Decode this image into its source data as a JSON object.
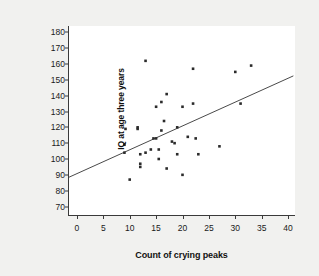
{
  "chart_data": {
    "type": "scatter",
    "title": "",
    "xlabel": "Count of crying peaks",
    "ylabel": "IQ at age three years",
    "xlim": [
      -1.5,
      41.5
    ],
    "ylim": [
      64,
      184
    ],
    "xticks": [
      0,
      5,
      10,
      15,
      20,
      25,
      30,
      35,
      40
    ],
    "yticks": [
      70,
      80,
      90,
      100,
      110,
      120,
      130,
      140,
      150,
      160,
      170,
      180
    ],
    "grid": false,
    "legend": false,
    "point_color": "#2b2b2b",
    "line_color": "#4a4a4a",
    "background": "#ffffff",
    "figure_background": "#f1f1ef",
    "points": [
      {
        "x": 10.0,
        "y": 87
      },
      {
        "x": 9.0,
        "y": 104
      },
      {
        "x": 9.0,
        "y": 109
      },
      {
        "x": 9.2,
        "y": 119
      },
      {
        "x": 11.5,
        "y": 119
      },
      {
        "x": 11.5,
        "y": 120
      },
      {
        "x": 12.0,
        "y": 103
      },
      {
        "x": 12.0,
        "y": 95
      },
      {
        "x": 12.0,
        "y": 97
      },
      {
        "x": 13.0,
        "y": 104
      },
      {
        "x": 13.0,
        "y": 162
      },
      {
        "x": 14.0,
        "y": 106
      },
      {
        "x": 14.5,
        "y": 113
      },
      {
        "x": 15.0,
        "y": 113
      },
      {
        "x": 15.0,
        "y": 133
      },
      {
        "x": 15.5,
        "y": 100
      },
      {
        "x": 15.5,
        "y": 106
      },
      {
        "x": 16.0,
        "y": 118
      },
      {
        "x": 16.0,
        "y": 136
      },
      {
        "x": 16.5,
        "y": 124
      },
      {
        "x": 17.0,
        "y": 94
      },
      {
        "x": 17.0,
        "y": 141
      },
      {
        "x": 18.0,
        "y": 111
      },
      {
        "x": 18.5,
        "y": 110
      },
      {
        "x": 19.0,
        "y": 103
      },
      {
        "x": 19.0,
        "y": 120
      },
      {
        "x": 20.0,
        "y": 90
      },
      {
        "x": 20.0,
        "y": 133
      },
      {
        "x": 21.0,
        "y": 114
      },
      {
        "x": 22.0,
        "y": 135
      },
      {
        "x": 22.0,
        "y": 157
      },
      {
        "x": 22.5,
        "y": 113
      },
      {
        "x": 23.0,
        "y": 103
      },
      {
        "x": 27.0,
        "y": 108
      },
      {
        "x": 30.0,
        "y": 155
      },
      {
        "x": 31.0,
        "y": 135
      },
      {
        "x": 33.0,
        "y": 159
      }
    ],
    "trend_line": {
      "type": "linear-fit",
      "x_start": -1.5,
      "y_start": 88.5,
      "x_end": 41.0,
      "y_end": 152.5
    }
  }
}
